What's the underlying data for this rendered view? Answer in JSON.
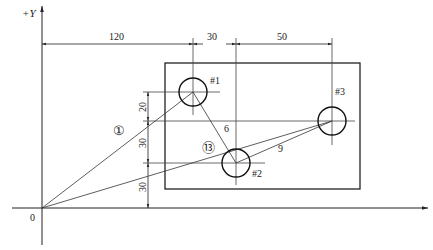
{
  "diagram": {
    "type": "drilling-path-drawing",
    "axes": {
      "y_label": "+Y",
      "origin_label": "0"
    },
    "horizontal_dimensions": [
      {
        "label": "120",
        "from_x": 0,
        "to_x": 120
      },
      {
        "label": "30",
        "from_x": 120,
        "to_x": 150
      },
      {
        "label": "50",
        "from_x": 150,
        "to_x": 200
      }
    ],
    "vertical_dimensions": [
      {
        "label": "20",
        "from_y": 90,
        "to_y": 70
      },
      {
        "label": "30",
        "from_y": 70,
        "to_y": 30
      },
      {
        "label": "30",
        "from_y": 30,
        "to_y": 0
      }
    ],
    "holes": [
      {
        "label": "#1",
        "x": 120,
        "y": 90
      },
      {
        "label": "#2",
        "x": 150,
        "y": 30
      },
      {
        "label": "#3",
        "x": 200,
        "y": 70
      }
    ],
    "path_labels": [
      {
        "label": "①",
        "meaning": "path 1: origin to hole #1"
      },
      {
        "label": "6",
        "meaning": "path #1 to #2"
      },
      {
        "label": "9",
        "meaning": "path #2 to #3"
      },
      {
        "label": "⑬",
        "meaning": "path 13: #3 back to origin"
      }
    ],
    "colors": {
      "line": "#222222",
      "thin": "#444444",
      "background": "#ffffff"
    }
  }
}
